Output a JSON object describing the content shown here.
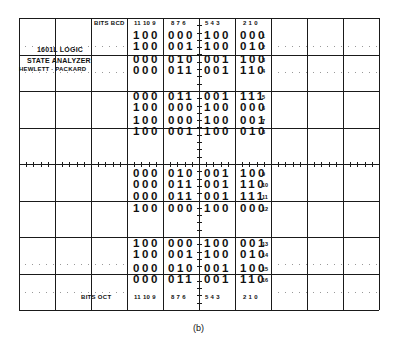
{
  "display": {
    "title_line1": "1601L LOGIC",
    "title_line2": "STATE ANALYZER",
    "title_line3": "HEWLETT · PACKARD",
    "header_label": "BITS BCD",
    "footer_label": "BITS OCT",
    "bit_groups": [
      "11 10 9",
      "8  7 6",
      "5 4  3",
      "2 1 0"
    ],
    "caption": "(b)"
  },
  "rows": [
    {
      "n": "1",
      "g": [
        "100",
        "000",
        "100",
        "000"
      ]
    },
    {
      "n": "2",
      "g": [
        "100",
        "001",
        "100",
        "010"
      ]
    },
    {
      "n": "3",
      "g": [
        "000",
        "010",
        "001",
        "100"
      ]
    },
    {
      "n": "4",
      "g": [
        "000",
        "011",
        "001",
        "110"
      ]
    },
    {
      "n": "5",
      "g": [
        "000",
        "011",
        "001",
        "111"
      ]
    },
    {
      "n": "6",
      "g": [
        "100",
        "000",
        "100",
        "000"
      ]
    },
    {
      "n": "7",
      "g": [
        "100",
        "000",
        "100",
        "001"
      ]
    },
    {
      "n": "8",
      "g": [
        "100",
        "001",
        "100",
        "010"
      ]
    },
    {
      "n": "9",
      "g": [
        "000",
        "010",
        "001",
        "100"
      ]
    },
    {
      "n": "10",
      "g": [
        "000",
        "011",
        "001",
        "110"
      ]
    },
    {
      "n": "11",
      "g": [
        "000",
        "011",
        "001",
        "111"
      ]
    },
    {
      "n": "12",
      "g": [
        "100",
        "000",
        "100",
        "000"
      ]
    },
    {
      "n": "13",
      "g": [
        "100",
        "000",
        "100",
        "001"
      ]
    },
    {
      "n": "14",
      "g": [
        "100",
        "001",
        "100",
        "010"
      ]
    },
    {
      "n": "15",
      "g": [
        "000",
        "010",
        "001",
        "100"
      ]
    },
    {
      "n": "16",
      "g": [
        "000",
        "011",
        "001",
        "110"
      ]
    }
  ]
}
